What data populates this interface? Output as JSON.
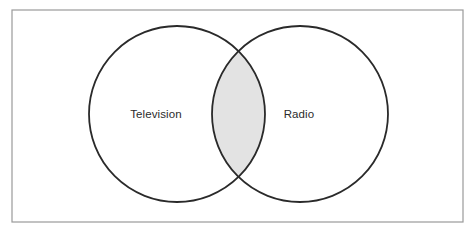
{
  "figure": {
    "type": "venn-diagram",
    "title": "",
    "background_color": "#ffffff",
    "frame": {
      "name": "outer-frame",
      "x": 12,
      "y": 10,
      "width": 451,
      "height": 212,
      "stroke_color": "#9a9a9a",
      "stroke_width": 1.2,
      "fill": "#ffffff"
    },
    "circle_stroke_color": "#2a2a2a",
    "circle_stroke_width": 1.8,
    "circle_fill": "#ffffff",
    "intersection_fill": "#e3e3e3",
    "label_color": "#2b2b2b",
    "sets": [
      {
        "id": "television",
        "label": "Television",
        "cx": 177,
        "cy": 114,
        "r": 88,
        "label_x": 156,
        "label_y": 115
      },
      {
        "id": "radio",
        "label": "Radio",
        "cx": 300,
        "cy": 114,
        "r": 88,
        "label_x": 299,
        "label_y": 115
      }
    ],
    "intersection": {
      "id": "television-radio-intersection",
      "label": "",
      "cusp_x": 238.5,
      "cusp_top_y": 57,
      "cusp_bottom_y": 171
    }
  }
}
